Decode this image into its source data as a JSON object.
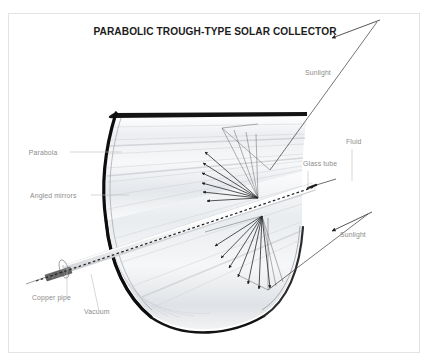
{
  "page": {
    "background": "#ffffff",
    "frame_color": "#e3e3e3",
    "width": 430,
    "height": 364
  },
  "title": {
    "text": "PARABOLIC TROUGH-TYPE SOLAR COLLECTOR",
    "color": "#1c1c1c"
  },
  "labels": {
    "parabola": "Parabola",
    "angled_mirrors": "Angled mirrors",
    "copper_pipe": "Copper pipe",
    "vacuum": "Vacuum",
    "glass_tube": "Glass tube",
    "fluid": "Fluid",
    "sunlight_top": "Sunlight",
    "sunlight_bottom": "Sunlight",
    "color": "#8c8c8c"
  },
  "diagram": {
    "type": "technical-illustration",
    "parts": [
      {
        "name": "parabola",
        "description": "thick black parabolic rim curve at the near end of the trough"
      },
      {
        "name": "angled-mirrors",
        "description": "light grey reflective mirror strips lining the inner trough surface"
      },
      {
        "name": "copper-pipe",
        "description": "dark grey absorber pipe protruding from the glass tube at lower left"
      },
      {
        "name": "vacuum",
        "description": "annular gap between copper pipe and surrounding glass tube"
      },
      {
        "name": "glass-tube",
        "description": "transparent tube running along the focal line of the trough"
      },
      {
        "name": "fluid",
        "description": "dashed centreline inside the absorber pipe representing heat transfer fluid"
      },
      {
        "name": "sunlight-rays",
        "description": "two incoming sun rays with arrowheads entering the trough"
      },
      {
        "name": "reflected-rays",
        "description": "fans of reflected rays converging on the absorber tube from above and below"
      }
    ],
    "colors": {
      "rim": "#111111",
      "mirror": "#d8dade",
      "pipe": "#6e6e6e",
      "ray": "#2a2a2a",
      "leader": "#b9b9b9"
    }
  }
}
